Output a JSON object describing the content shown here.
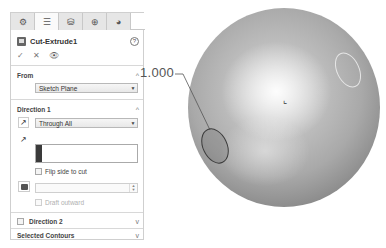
{
  "panel": {
    "tabs": [
      {
        "icon": "feature-manager-icon",
        "glyph": "⚙"
      },
      {
        "icon": "property-manager-icon",
        "glyph": "☰"
      },
      {
        "icon": "configuration-manager-icon",
        "glyph": "⛁"
      },
      {
        "icon": "dimxpert-icon",
        "glyph": "⊕"
      },
      {
        "icon": "display-manager-icon",
        "glyph": "◕"
      }
    ],
    "title": "Cut-Extrude1",
    "help_glyph": "?",
    "actions": {
      "ok": "✓",
      "cancel": "✕",
      "preview": "👁"
    },
    "from": {
      "label": "From",
      "chevron": "^",
      "value": "Sketch Plane"
    },
    "direction1": {
      "label": "Direction 1",
      "chevron": "^",
      "end_condition": "Through All",
      "flip_label": "Flip side to cut",
      "draft_value": "",
      "draft_outward_label": "Draft outward"
    },
    "direction2": {
      "label": "Direction 2",
      "chevron": "v"
    },
    "selected_contours": {
      "label": "Selected Contours",
      "chevron": "v"
    }
  },
  "viewport": {
    "dimension_value": "1.000",
    "origin_glyph": "⌞"
  }
}
